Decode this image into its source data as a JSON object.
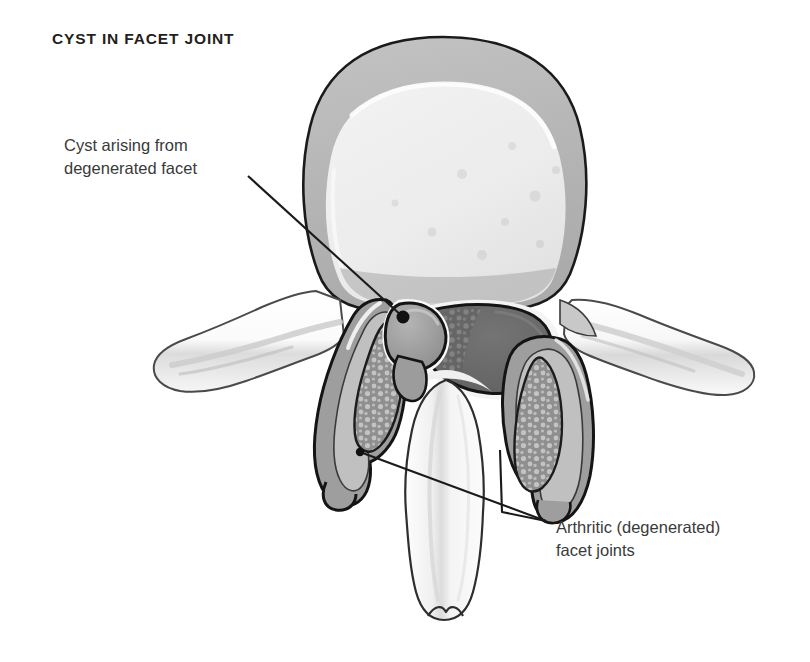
{
  "figure": {
    "title": "CYST IN FACET JOINT",
    "width": 810,
    "height": 662,
    "background_color": "#ffffff",
    "view": "axial (superior) cross-section through a lumbar vertebra"
  },
  "annotations": [
    {
      "id": "cyst-label",
      "text": "Cyst arising from\ndegenerated facet",
      "line1": "Cyst arising from",
      "line2": "degenerated facet",
      "text_color": "#3a3a3a",
      "text_x": 64,
      "text_y": 134,
      "leader": {
        "from_x": 248,
        "from_y": 176,
        "to_x": 403,
        "to_y": 317,
        "marker": "filled-dot",
        "marker_radius": 6,
        "color": "#1a1a1a"
      }
    },
    {
      "id": "facet-joints-label",
      "text": "Arthritic (degenerated)\nfacet joints",
      "line1": "Arthritic (degenerated)",
      "line2": "facet joints",
      "text_color": "#3a3a3a",
      "text_x": 556,
      "text_y": 516,
      "leaders": [
        {
          "from_x": 360,
          "from_y": 452,
          "to_x": 546,
          "to_y": 521,
          "marker": "filled-dot",
          "marker_radius": 4,
          "color": "#1a1a1a",
          "target": "left-facet-joint"
        },
        {
          "from_x": 500,
          "from_y": 450,
          "to_x": 546,
          "to_y": 521,
          "marker": "none",
          "color": "#1a1a1a",
          "target": "right-facet-joint"
        }
      ]
    }
  ],
  "palette": {
    "outline_dark": "#1a1a1a",
    "outline_mid": "#555555",
    "bone_white": "#fcfcfc",
    "bone_light": "#f0f0f0",
    "cortical_gray": "#b8b8b8",
    "cancellous_light": "#e8e8e8",
    "cyst_gray": "#9a9a9a",
    "cyst_gray_dark": "#8a8a8a",
    "thecal_dark": "#6b6b6b",
    "thecal_darker": "#5a5a5a",
    "speckle_gray": "#bdbdbd",
    "facet_mid": "#a0a0a0",
    "shadow_gray": "#cccccc"
  },
  "structures": [
    {
      "name": "vertebral-body",
      "label": "Vertebral body",
      "fill": "#b8b8b8",
      "interior_fill": "#ededed"
    },
    {
      "name": "left-transverse-process",
      "label": "Left transverse process",
      "fill": "#fafafa"
    },
    {
      "name": "right-transverse-process",
      "label": "Right transverse process",
      "fill": "#fafafa"
    },
    {
      "name": "synovial-cyst",
      "label": "Synovial cyst arising from degenerated facet",
      "fill": "#9a9a9a"
    },
    {
      "name": "thecal-sac",
      "label": "Thecal sac / spinal canal contents",
      "fill": "#6b6b6b"
    },
    {
      "name": "left-facet-joint",
      "label": "Left arthritic facet joint",
      "fill": "#a0a0a0"
    },
    {
      "name": "right-facet-joint",
      "label": "Right arthritic facet joint",
      "fill": "#a0a0a0"
    },
    {
      "name": "left-lamina",
      "label": "Left lamina",
      "fill": "#b0b0b0"
    },
    {
      "name": "right-lamina",
      "label": "Right lamina",
      "fill": "#b0b0b0"
    },
    {
      "name": "spinous-process",
      "label": "Spinous process",
      "fill": "#fafafa"
    }
  ]
}
